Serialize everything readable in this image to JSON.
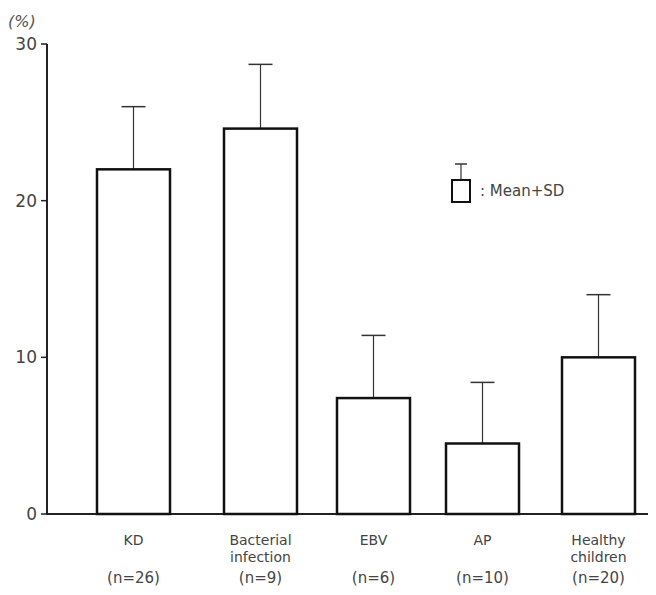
{
  "chart_data": {
    "type": "bar",
    "title": "",
    "xlabel": "",
    "ylabel": "(%)",
    "ylim": [
      0,
      30
    ],
    "yticks": [
      0,
      10,
      20,
      30
    ],
    "grid": false,
    "categories": [
      "KD",
      "Bacterial infection",
      "EBV",
      "AP",
      "Healthy children"
    ],
    "category_lines": [
      [
        "KD"
      ],
      [
        "Bacterial",
        "infection"
      ],
      [
        "EBV"
      ],
      [
        "AP"
      ],
      [
        "Healthy",
        "children"
      ]
    ],
    "n_labels": [
      "(n=26)",
      "(n=9)",
      "(n=6)",
      "(n=10)",
      "(n=20)"
    ],
    "series": [
      {
        "name": "Mean",
        "values": [
          22.0,
          24.6,
          7.4,
          4.5,
          10.0
        ],
        "sd": [
          4.0,
          4.1,
          4.0,
          3.9,
          4.0
        ]
      }
    ],
    "legend": {
      "text": ": Mean+SD",
      "position": "upper right"
    },
    "bar_fill": "#ffffff",
    "bar_stroke": "#111111"
  }
}
